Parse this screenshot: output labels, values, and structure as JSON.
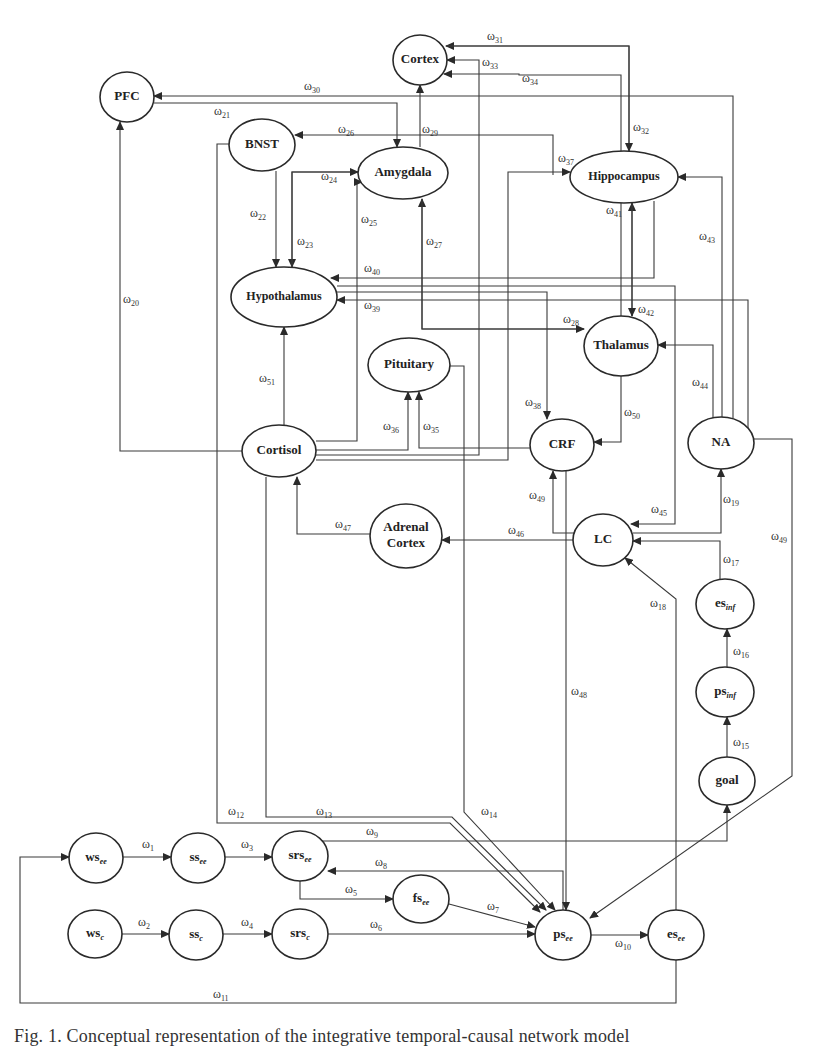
{
  "figure": {
    "caption": "Fig. 1. Conceptual representation of the integrative temporal-causal network model",
    "stroke_color": "#2a2a2a",
    "background": "#ffffff"
  },
  "nodes": [
    {
      "id": "cortex",
      "label": "Cortex",
      "cx": 420,
      "cy": 60,
      "rx": 27,
      "ry": 25
    },
    {
      "id": "pfc",
      "label": "PFC",
      "cx": 127,
      "cy": 97,
      "rx": 27,
      "ry": 25
    },
    {
      "id": "bnst",
      "label": "BNST",
      "cx": 262,
      "cy": 145,
      "rx": 33,
      "ry": 26
    },
    {
      "id": "amygdala",
      "label": "Amygdala",
      "cx": 403,
      "cy": 173,
      "rx": 45,
      "ry": 26
    },
    {
      "id": "hippocampus",
      "label": "Hippocampus",
      "cx": 624,
      "cy": 177,
      "rx": 54,
      "ry": 26
    },
    {
      "id": "hypothalamus",
      "label": "Hypothalamus",
      "cx": 284,
      "cy": 297,
      "rx": 53,
      "ry": 30
    },
    {
      "id": "thalamus",
      "label": "Thalamus",
      "cx": 621,
      "cy": 346,
      "rx": 37,
      "ry": 30
    },
    {
      "id": "pituitary",
      "label": "Pituitary",
      "cx": 409,
      "cy": 365,
      "rx": 41,
      "ry": 27
    },
    {
      "id": "cortisol",
      "label": "Cortisol",
      "cx": 279,
      "cy": 451,
      "rx": 37,
      "ry": 26
    },
    {
      "id": "crf",
      "label": "CRF",
      "cx": 562,
      "cy": 445,
      "rx": 32,
      "ry": 26
    },
    {
      "id": "na",
      "label": "NA",
      "cx": 721,
      "cy": 443,
      "rx": 33,
      "ry": 26
    },
    {
      "id": "adrenal",
      "label": "Adrenal Cortex",
      "line1": "Adrenal",
      "line2": "Cortex",
      "cx": 406,
      "cy": 536,
      "rx": 36,
      "ry": 32
    },
    {
      "id": "lc",
      "label": "LC",
      "cx": 603,
      "cy": 540,
      "rx": 30,
      "ry": 26
    },
    {
      "id": "es_inf",
      "label": "es",
      "sub": "inf",
      "cx": 725,
      "cy": 604,
      "rx": 29,
      "ry": 25
    },
    {
      "id": "ps_inf",
      "label": "ps",
      "sub": "inf",
      "cx": 725,
      "cy": 692,
      "rx": 29,
      "ry": 25
    },
    {
      "id": "goal",
      "label": "goal",
      "cx": 727,
      "cy": 781,
      "rx": 28,
      "ry": 24
    },
    {
      "id": "ws_ee",
      "label": "ws",
      "sub": "ee",
      "cx": 96,
      "cy": 858,
      "rx": 27,
      "ry": 25
    },
    {
      "id": "ss_ee",
      "label": "ss",
      "sub": "ee",
      "cx": 198,
      "cy": 858,
      "rx": 27,
      "ry": 25
    },
    {
      "id": "srs_ee",
      "label": "srs",
      "sub": "ee",
      "cx": 300,
      "cy": 856,
      "rx": 28,
      "ry": 25
    },
    {
      "id": "fs_ee",
      "label": "fs",
      "sub": "ee",
      "cx": 421,
      "cy": 899,
      "rx": 28,
      "ry": 24
    },
    {
      "id": "ws_c",
      "label": "ws",
      "sub": "c",
      "cx": 95,
      "cy": 934,
      "rx": 27,
      "ry": 24
    },
    {
      "id": "ss_c",
      "label": "ss",
      "sub": "c",
      "cx": 196,
      "cy": 935,
      "rx": 27,
      "ry": 25
    },
    {
      "id": "srs_c",
      "label": "srs",
      "sub": "c",
      "cx": 300,
      "cy": 934,
      "rx": 28,
      "ry": 25
    },
    {
      "id": "ps_ee",
      "label": "ps",
      "sub": "ee",
      "cx": 563,
      "cy": 935,
      "rx": 28,
      "ry": 25
    },
    {
      "id": "es_ee",
      "label": "es",
      "sub": "ee",
      "cx": 676,
      "cy": 935,
      "rx": 28,
      "ry": 25
    }
  ],
  "edges": [
    {
      "w": "1",
      "from": "ws_ee",
      "to": "ss_ee",
      "pts": [
        [
          123,
          857
        ],
        [
          171,
          857
        ]
      ],
      "arrow": true,
      "lx": 142,
      "ly": 848
    },
    {
      "w": "2",
      "from": "ws_c",
      "to": "ss_c",
      "pts": [
        [
          122,
          934
        ],
        [
          169,
          934
        ]
      ],
      "arrow": true,
      "lx": 138,
      "ly": 926
    },
    {
      "w": "3",
      "from": "ss_ee",
      "to": "srs_ee",
      "pts": [
        [
          225,
          857
        ],
        [
          272,
          857
        ]
      ],
      "arrow": true,
      "lx": 241,
      "ly": 848
    },
    {
      "w": "4",
      "from": "ss_c",
      "to": "srs_c",
      "pts": [
        [
          223,
          934
        ],
        [
          272,
          934
        ]
      ],
      "arrow": true,
      "lx": 241,
      "ly": 926
    },
    {
      "w": "5",
      "from": "srs_ee",
      "to": "fs_ee",
      "pts": [
        [
          300,
          881
        ],
        [
          300,
          899
        ],
        [
          393,
          899
        ]
      ],
      "arrow": true,
      "lx": 345,
      "ly": 893
    },
    {
      "w": "6",
      "from": "srs_c",
      "to": "ps_ee",
      "pts": [
        [
          328,
          934
        ],
        [
          535,
          934
        ]
      ],
      "arrow": true,
      "lx": 370,
      "ly": 928
    },
    {
      "w": "7",
      "from": "fs_ee",
      "to": "ps_ee",
      "pts": [
        [
          449,
          904
        ],
        [
          535,
          927
        ]
      ],
      "arrow": true,
      "lx": 487,
      "ly": 910
    },
    {
      "w": "8",
      "from": "ps_ee",
      "to": "srs_ee",
      "pts": [
        [
          563,
          910
        ],
        [
          563,
          871
        ],
        [
          328,
          871
        ]
      ],
      "arrow": true,
      "lx": 375,
      "ly": 866
    },
    {
      "w": "9",
      "from": "srs_ee",
      "to": "goal",
      "pts": [
        [
          320,
          841
        ],
        [
          727,
          841
        ],
        [
          727,
          805
        ]
      ],
      "arrow": true,
      "lx": 366,
      "ly": 835
    },
    {
      "w": "10",
      "from": "ps_ee",
      "to": "es_ee",
      "pts": [
        [
          591,
          935
        ],
        [
          648,
          935
        ]
      ],
      "arrow": true,
      "lx": 615,
      "ly": 947
    },
    {
      "w": "11",
      "from": "es_ee",
      "to": "ws_ee",
      "pts": [
        [
          676,
          960
        ],
        [
          676,
          1003
        ],
        [
          20,
          1003
        ],
        [
          20,
          857
        ],
        [
          69,
          857
        ]
      ],
      "arrow": true,
      "lx": 213,
      "ly": 998
    },
    {
      "w": "12",
      "from": "bnst",
      "to": "ps_ee",
      "pts": [
        [
          229,
          144
        ],
        [
          217,
          144
        ],
        [
          217,
          823
        ],
        [
          450,
          823
        ],
        [
          540,
          912
        ]
      ],
      "arrow": true,
      "lx": 228,
      "ly": 815
    },
    {
      "w": "13",
      "from": "cortisol",
      "to": "ps_ee",
      "pts": [
        [
          266,
          477
        ],
        [
          266,
          817
        ],
        [
          452,
          817
        ],
        [
          546,
          910
        ]
      ],
      "arrow": true,
      "lx": 316,
      "ly": 815
    },
    {
      "w": "14",
      "from": "pituitary",
      "to": "ps_ee",
      "pts": [
        [
          450,
          366
        ],
        [
          464,
          366
        ],
        [
          464,
          812
        ],
        [
          555,
          910
        ]
      ],
      "arrow": true,
      "lx": 481,
      "ly": 815
    },
    {
      "w": "15",
      "from": "goal",
      "to": "ps_inf",
      "pts": [
        [
          727,
          757
        ],
        [
          727,
          717
        ]
      ],
      "arrow": true,
      "lx": 733,
      "ly": 746
    },
    {
      "w": "16",
      "from": "ps_inf",
      "to": "es_inf",
      "pts": [
        [
          727,
          667
        ],
        [
          727,
          629
        ]
      ],
      "arrow": true,
      "lx": 733,
      "ly": 655
    },
    {
      "w": "17",
      "from": "es_inf",
      "to": "lc",
      "pts": [
        [
          720,
          579
        ],
        [
          720,
          541
        ],
        [
          633,
          541
        ]
      ],
      "arrow": true,
      "lx": 723,
      "ly": 563
    },
    {
      "w": "18",
      "from": "es_ee",
      "to": "lc",
      "pts": [
        [
          676,
          910
        ],
        [
          676,
          599
        ],
        [
          625,
          558
        ]
      ],
      "arrow": true,
      "lx": 650,
      "ly": 607
    },
    {
      "w": "19",
      "from": "lc",
      "to": "na",
      "pts": [
        [
          633,
          533
        ],
        [
          721,
          533
        ],
        [
          721,
          469
        ]
      ],
      "arrow": true,
      "lx": 723,
      "ly": 503
    },
    {
      "w": "20",
      "from": "cortisol",
      "to": "pfc",
      "pts": [
        [
          242,
          451
        ],
        [
          120,
          451
        ],
        [
          120,
          122
        ]
      ],
      "arrow": true,
      "lx": 123,
      "ly": 303
    },
    {
      "w": "21",
      "from": "pfc",
      "to": "amygdala",
      "pts": [
        [
          154,
          103
        ],
        [
          397,
          103
        ],
        [
          397,
          147
        ]
      ],
      "arrow": true,
      "lx": 214,
      "ly": 115
    },
    {
      "w": "22",
      "from": "bnst",
      "to": "hypothalamus",
      "pts": [
        [
          276,
          171
        ],
        [
          276,
          267
        ]
      ],
      "arrow": true,
      "lx": 250,
      "ly": 217
    },
    {
      "w": "23",
      "from": "amygdala",
      "to": "hypothalamus",
      "pts": [
        [
          358,
          172
        ],
        [
          292,
          172
        ],
        [
          292,
          267
        ]
      ],
      "arrow": true,
      "lx": 297,
      "ly": 245
    },
    {
      "w": "24",
      "from": "hypothalamus",
      "to": "amygdala",
      "pts": [
        [
          292,
          267
        ],
        [
          292,
          172
        ],
        [
          358,
          172
        ]
      ],
      "arrow": true,
      "lx": 321,
      "ly": 180
    },
    {
      "w": "25",
      "from": "cortisol",
      "to": "amygdala",
      "pts": [
        [
          316,
          441
        ],
        [
          357,
          441
        ],
        [
          357,
          182
        ],
        [
          362,
          182
        ]
      ],
      "arrow": true,
      "lx": 361,
      "ly": 223
    },
    {
      "w": "26",
      "from": "hippocampus",
      "to": "bnst",
      "pts": [
        [
          553,
          175
        ],
        [
          553,
          135
        ],
        [
          295,
          135
        ]
      ],
      "arrow": true,
      "lx": 338,
      "ly": 133
    },
    {
      "w": "27",
      "from": "thalamus",
      "to": "amygdala",
      "pts": [
        [
          584,
          329
        ],
        [
          422,
          329
        ],
        [
          422,
          199
        ]
      ],
      "arrow": true,
      "lx": 426,
      "ly": 245
    },
    {
      "w": "28",
      "from": "amygdala",
      "to": "thalamus",
      "pts": [
        [
          422,
          199
        ],
        [
          422,
          329
        ],
        [
          584,
          329
        ]
      ],
      "arrow": true,
      "lx": 563,
      "ly": 323
    },
    {
      "w": "29",
      "from": "amygdala",
      "to": "cortex",
      "pts": [
        [
          420,
          147
        ],
        [
          420,
          85
        ]
      ],
      "arrow": true,
      "lx": 422,
      "ly": 133
    },
    {
      "w": "30",
      "from": "na",
      "to": "pfc",
      "pts": [
        [
          733,
          418
        ],
        [
          733,
          96
        ],
        [
          154,
          96
        ]
      ],
      "arrow": true,
      "lx": 304,
      "ly": 90
    },
    {
      "w": "31",
      "from": "hippocampus",
      "to": "cortex",
      "pts": [
        [
          629,
          151
        ],
        [
          629,
          46
        ],
        [
          446,
          46
        ]
      ],
      "arrow": true,
      "lx": 487,
      "ly": 40
    },
    {
      "w": "32",
      "from": "cortex",
      "to": "hippocampus",
      "pts": [
        [
          446,
          46
        ],
        [
          629,
          46
        ],
        [
          629,
          151
        ]
      ],
      "arrow": true,
      "lx": 633,
      "ly": 131
    },
    {
      "w": "33",
      "from": "cortisol",
      "to": "cortex",
      "pts": [
        [
          316,
          455
        ],
        [
          479,
          455
        ],
        [
          479,
          60
        ],
        [
          447,
          60
        ]
      ],
      "arrow": true,
      "lx": 482,
      "ly": 66
    },
    {
      "w": "34",
      "from": "thalamus",
      "to": "cortex",
      "pts": [
        [
          621,
          316
        ],
        [
          621,
          75
        ],
        [
          519,
          75
        ],
        [
          519,
          74
        ],
        [
          444,
          74
        ]
      ],
      "arrow": true,
      "lx": 522,
      "ly": 82
    },
    {
      "w": "35",
      "from": "crf",
      "to": "pituitary",
      "pts": [
        [
          530,
          448
        ],
        [
          419,
          448
        ],
        [
          419,
          392
        ]
      ],
      "arrow": true,
      "lx": 423,
      "ly": 430
    },
    {
      "w": "36",
      "from": "cortisol",
      "to": "pituitary",
      "pts": [
        [
          316,
          450
        ],
        [
          408,
          450
        ],
        [
          408,
          392
        ]
      ],
      "arrow": true,
      "lx": 383,
      "ly": 430
    },
    {
      "w": "37",
      "from": "cortisol",
      "to": "hippocampus",
      "pts": [
        [
          316,
          460
        ],
        [
          508,
          460
        ],
        [
          508,
          172
        ],
        [
          570,
          172
        ]
      ],
      "arrow": true,
      "lx": 558,
      "ly": 162
    },
    {
      "w": "38",
      "from": "hypothalamus",
      "to": "crf",
      "pts": [
        [
          337,
          292
        ],
        [
          547,
          292
        ],
        [
          547,
          419
        ]
      ],
      "arrow": true,
      "lx": 525,
      "ly": 406
    },
    {
      "w": "39",
      "from": "na",
      "to": "hypothalamus",
      "pts": [
        [
          748,
          436
        ],
        [
          748,
          300
        ],
        [
          337,
          300
        ]
      ],
      "arrow": true,
      "lx": 364,
      "ly": 309
    },
    {
      "w": "40",
      "from": "hippocampus",
      "to": "hypothalamus",
      "pts": [
        [
          654,
          201
        ],
        [
          654,
          278
        ],
        [
          331,
          278
        ]
      ],
      "arrow": true,
      "lx": 364,
      "ly": 272
    },
    {
      "w": "41",
      "from": "thalamus",
      "to": "hippocampus",
      "pts": [
        [
          632,
          316
        ],
        [
          632,
          203
        ]
      ],
      "arrow": true,
      "lx": 606,
      "ly": 214
    },
    {
      "w": "42",
      "from": "hippocampus",
      "to": "thalamus",
      "pts": [
        [
          632,
          203
        ],
        [
          632,
          316
        ]
      ],
      "arrow": true,
      "lx": 638,
      "ly": 313
    },
    {
      "w": "43",
      "from": "na",
      "to": "hippocampus",
      "pts": [
        [
          722,
          417
        ],
        [
          722,
          177
        ],
        [
          678,
          177
        ]
      ],
      "arrow": true,
      "lx": 699,
      "ly": 240
    },
    {
      "w": "44",
      "from": "na",
      "to": "thalamus",
      "pts": [
        [
          713,
          418
        ],
        [
          713,
          345
        ],
        [
          658,
          345
        ]
      ],
      "arrow": true,
      "lx": 692,
      "ly": 386
    },
    {
      "w": "45",
      "from": "hypothalamus",
      "to": "lc",
      "pts": [
        [
          337,
          286
        ],
        [
          675,
          286
        ],
        [
          675,
          524
        ],
        [
          631,
          524
        ]
      ],
      "arrow": true,
      "lx": 651,
      "ly": 513
    },
    {
      "w": "46",
      "from": "lc",
      "to": "adrenal",
      "pts": [
        [
          573,
          540
        ],
        [
          442,
          540
        ]
      ],
      "arrow": true,
      "lx": 508,
      "ly": 534
    },
    {
      "w": "47",
      "from": "adrenal",
      "to": "cortisol",
      "pts": [
        [
          370,
          534
        ],
        [
          297,
          534
        ],
        [
          297,
          477
        ]
      ],
      "arrow": true,
      "lx": 335,
      "ly": 528
    },
    {
      "w": "48",
      "from": "crf",
      "to": "ps_ee",
      "pts": [
        [
          566,
          471
        ],
        [
          566,
          910
        ]
      ],
      "arrow": true,
      "lx": 571,
      "ly": 695
    },
    {
      "w": "49",
      "from": "lc",
      "to": "crf",
      "pts": [
        [
          575,
          533
        ],
        [
          553,
          533
        ],
        [
          553,
          471
        ]
      ],
      "arrow": true,
      "lx": 529,
      "ly": 499
    },
    {
      "w": "49b",
      "display": "49",
      "from": "na",
      "to": "ps_ee",
      "pts": [
        [
          754,
          439
        ],
        [
          792,
          439
        ],
        [
          792,
          776
        ],
        [
          590,
          918
        ]
      ],
      "arrow": true,
      "lx": 771,
      "ly": 540
    },
    {
      "w": "50",
      "from": "thalamus",
      "to": "crf",
      "pts": [
        [
          621,
          376
        ],
        [
          621,
          442
        ],
        [
          594,
          442
        ]
      ],
      "arrow": true,
      "lx": 624,
      "ly": 416
    },
    {
      "w": "51",
      "from": "cortisol",
      "to": "hypothalamus",
      "pts": [
        [
          284,
          425
        ],
        [
          284,
          327
        ]
      ],
      "arrow": true,
      "lx": 259,
      "ly": 382
    }
  ],
  "labels_prefix": "ω"
}
